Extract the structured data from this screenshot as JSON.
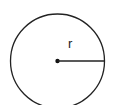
{
  "diagram": {
    "type": "circle-radius",
    "radius_label": "r",
    "colors": {
      "stroke": "#222222",
      "background": "#ffffff"
    }
  }
}
